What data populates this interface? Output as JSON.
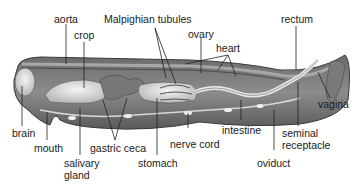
{
  "figure": {
    "labels": {
      "aorta": "aorta",
      "crop": "crop",
      "malpighian": "Malpighian tubules",
      "ovary": "ovary",
      "heart": "heart",
      "rectum": "rectum",
      "vagina": "vagina",
      "brain": "brain",
      "mouth": "mouth",
      "gastric_ceca": "gastric ceca",
      "salivary_1": "salivary",
      "salivary_2": "gland",
      "stomach": "stomach",
      "nerve_cord": "nerve cord",
      "intestine": "intestine",
      "seminal_1": "seminal",
      "seminal_2": "receptacle",
      "oviduct": "oviduct"
    },
    "colors": {
      "body_outer": "#5a5a5a",
      "body_inner": "#8a8a8a",
      "organ_light": "#e6e6e6",
      "line": "#222222"
    }
  }
}
